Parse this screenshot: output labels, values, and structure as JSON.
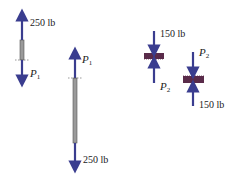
{
  "diagram": {
    "colors": {
      "arrow": "#3a3d8f",
      "rod": "#9a9a9a",
      "block": "#5a2b4a"
    },
    "fbd1": {
      "top_force": "250 lb",
      "bottom_label": "P",
      "bottom_sub": "1"
    },
    "fbd2": {
      "top_label": "P",
      "top_sub": "1",
      "bottom_force": "250 lb"
    },
    "fbd3": {
      "top_force": "150 lb",
      "bottom_label": "P",
      "bottom_sub": "2"
    },
    "fbd4": {
      "top_label": "P",
      "top_sub": "2",
      "bottom_force": "150 lb"
    }
  }
}
